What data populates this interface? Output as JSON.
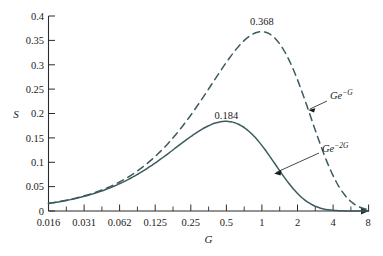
{
  "chart_data": {
    "type": "line",
    "title": "",
    "subtitle": "",
    "xlabel": "G",
    "ylabel": "S",
    "x_scale": "log2",
    "xlim": [
      0.016,
      8
    ],
    "ylim": [
      0,
      0.4
    ],
    "grid": false,
    "legend_position": "inline-annotation",
    "xticks": [
      "0.016",
      "0.031",
      "0.062",
      "0.125",
      "0.25",
      "0.5",
      "1",
      "2",
      "4",
      "8"
    ],
    "xtick_values": [
      0.016,
      0.031,
      0.062,
      0.125,
      0.25,
      0.5,
      1,
      2,
      4,
      8
    ],
    "yticks": [
      "0",
      "0.05",
      "0.1",
      "0.15",
      "0.2",
      "0.25",
      "0.3",
      "0.35",
      "0.4"
    ],
    "ytick_values": [
      0,
      0.05,
      0.1,
      0.15,
      0.2,
      0.25,
      0.3,
      0.35,
      0.4
    ],
    "series": [
      {
        "name": "Ge^-G",
        "label_base": "Ge",
        "label_exponent": "−G",
        "style": "dashed",
        "color": "#3d5a5f",
        "peak_x": 1,
        "peak_y": 0.368,
        "peak_label": "0.368",
        "x": [
          0.016,
          0.031,
          0.062,
          0.125,
          0.25,
          0.35,
          0.5,
          0.7,
          1,
          1.4,
          2,
          2.8,
          4,
          5.6,
          8
        ],
        "values": [
          0.0157,
          0.0301,
          0.0583,
          0.1103,
          0.1947,
          0.2467,
          0.3033,
          0.3476,
          0.3679,
          0.3452,
          0.2707,
          0.1702,
          0.0733,
          0.0208,
          0.0027
        ]
      },
      {
        "name": "Ge^-2G",
        "label_base": "Ge",
        "label_exponent": "−2G",
        "style": "solid",
        "color": "#3d5a5f",
        "peak_x": 0.5,
        "peak_y": 0.184,
        "peak_label": "0.184",
        "x": [
          0.016,
          0.031,
          0.062,
          0.125,
          0.25,
          0.35,
          0.5,
          0.7,
          1,
          1.4,
          2,
          2.8,
          4,
          5.6,
          8
        ],
        "values": [
          0.0155,
          0.0291,
          0.0548,
          0.0974,
          0.1516,
          0.1738,
          0.1839,
          0.1726,
          0.1353,
          0.0851,
          0.0366,
          0.0104,
          0.0013,
          0.0001,
          0.0
        ]
      }
    ],
    "annotations": [
      {
        "text": "0.368",
        "kind": "peak-value",
        "series": "Ge^-G"
      },
      {
        "text": "0.184",
        "kind": "peak-value",
        "series": "Ge^-2G"
      },
      {
        "text": "Ge^-G",
        "kind": "series-callout",
        "series": "Ge^-G"
      },
      {
        "text": "Ge^-2G",
        "kind": "series-callout",
        "series": "Ge^-2G"
      }
    ],
    "colors": {
      "curve": "#3d5a5f",
      "axis": "#2b2b2b",
      "text": "#1a1a1a",
      "background": "#ffffff"
    }
  }
}
